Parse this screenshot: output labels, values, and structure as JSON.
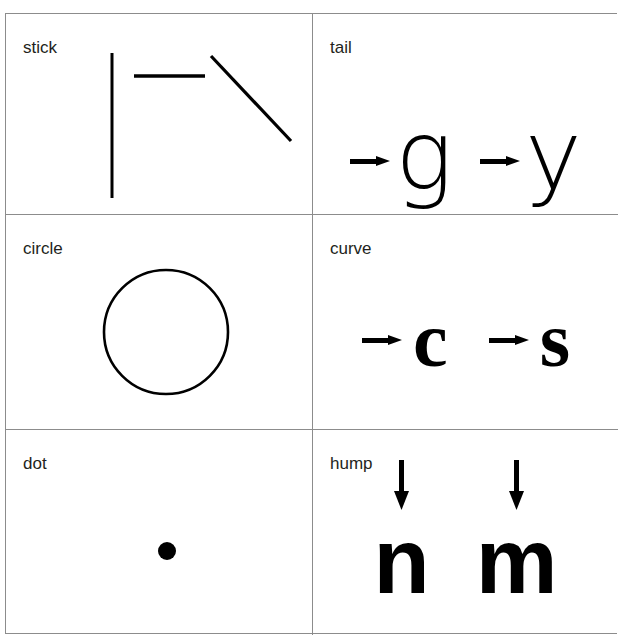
{
  "figure": {
    "type": "letter-feature-grid",
    "rows": 3,
    "columns": 2,
    "border_color": "#8c8c8c",
    "ink_color": "#000000",
    "background_color": "#ffffff"
  },
  "cells": [
    {
      "id": "stick",
      "label": "stick",
      "row": 0,
      "column": 0,
      "content_kind": "strokes",
      "strokes": [
        {
          "name": "vertical-stroke",
          "x1": 106,
          "y1": 39,
          "x2": 106,
          "y2": 184,
          "width": 3
        },
        {
          "name": "horizontal-stroke",
          "x1": 128,
          "y1": 62,
          "x2": 199,
          "y2": 62,
          "width": 3
        },
        {
          "name": "diagonal-stroke",
          "x1": 205,
          "y1": 42,
          "x2": 285,
          "y2": 127,
          "width": 3
        }
      ]
    },
    {
      "id": "tail",
      "label": "tail",
      "row": 0,
      "column": 1,
      "content_kind": "letters",
      "arrow_direction": "right",
      "letters": [
        "g",
        "y"
      ],
      "letter_style": "thin"
    },
    {
      "id": "circle",
      "label": "circle",
      "row": 1,
      "column": 0,
      "content_kind": "shape",
      "shape": {
        "name": "circle-outline",
        "cx": 160,
        "cy": 117,
        "r": 62,
        "stroke_width": 2.6
      }
    },
    {
      "id": "curve",
      "label": "curve",
      "row": 1,
      "column": 1,
      "content_kind": "letters",
      "arrow_direction": "right",
      "letters": [
        "c",
        "s"
      ],
      "letter_style": "bold-serifish"
    },
    {
      "id": "dot",
      "label": "dot",
      "row": 2,
      "column": 0,
      "content_kind": "shape",
      "shape": {
        "name": "filled-dot",
        "cx": 161,
        "cy": 121,
        "r": 9
      }
    },
    {
      "id": "hump",
      "label": "hump",
      "row": 2,
      "column": 1,
      "content_kind": "letters",
      "arrow_direction": "down",
      "letters": [
        "n",
        "m"
      ],
      "letter_style": "bold-sans"
    }
  ]
}
